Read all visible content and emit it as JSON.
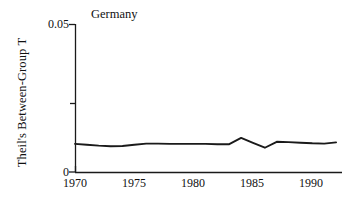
{
  "chart_data": {
    "type": "line",
    "title": "Germany",
    "xlabel": "",
    "ylabel": "Theil's Between-Group T",
    "xlim": [
      1970,
      1992.5
    ],
    "ylim": [
      0,
      0.05
    ],
    "grid": false,
    "legend": null,
    "x_ticks": [
      1970,
      1975,
      1980,
      1985,
      1990
    ],
    "x_tick_labels": [
      "1970",
      "1975",
      "1980",
      "1985",
      "1990"
    ],
    "y_ticks": [
      0,
      0.025,
      0.05
    ],
    "y_tick_labels": [
      "0",
      "",
      "0.05"
    ],
    "y_axis_min_label": "0",
    "y_axis_max_label": "0.05",
    "series": [
      {
        "name": "Germany",
        "color": "#1a1a1a",
        "x": [
          1970,
          1971,
          1972,
          1973,
          1974,
          1975,
          1976,
          1977,
          1978,
          1979,
          1980,
          1981,
          1982,
          1983,
          1984,
          1985,
          1986,
          1987,
          1988,
          1989,
          1990,
          1991,
          1992
        ],
        "values": [
          0.0095,
          0.0092,
          0.0089,
          0.0087,
          0.0088,
          0.0092,
          0.0096,
          0.0096,
          0.0095,
          0.0095,
          0.0095,
          0.0095,
          0.0094,
          0.0094,
          0.0115,
          0.0098,
          0.0082,
          0.0102,
          0.0101,
          0.0099,
          0.0097,
          0.0096,
          0.01
        ]
      }
    ]
  }
}
